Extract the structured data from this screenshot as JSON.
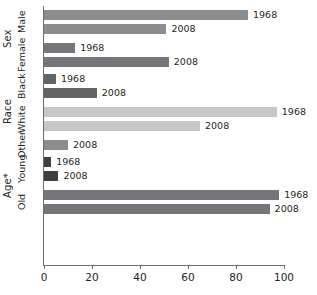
{
  "chart_data": {
    "type": "bar",
    "orientation": "horizontal",
    "title": "",
    "xlabel": "",
    "ylabel": "",
    "xlim": [
      0,
      100
    ],
    "xticks": [
      0,
      20,
      40,
      60,
      80,
      100
    ],
    "grid": false,
    "legend": "none",
    "note": "Age*",
    "groups": [
      {
        "group": "Sex",
        "categories": [
          {
            "name": "Male",
            "color": "#8c8d8f",
            "bars": [
              {
                "label": "1968",
                "value": 85
              },
              {
                "label": "2008",
                "value": 51
              }
            ]
          },
          {
            "name": "Female",
            "color": "#757679",
            "bars": [
              {
                "label": "1968",
                "value": 13
              },
              {
                "label": "2008",
                "value": 52
              }
            ]
          }
        ]
      },
      {
        "group": "Race",
        "categories": [
          {
            "name": "Black",
            "color": "#636466",
            "bars": [
              {
                "label": "1968",
                "value": 5
              },
              {
                "label": "2008",
                "value": 22
              }
            ]
          },
          {
            "name": "White",
            "color": "#c6c7c9",
            "bars": [
              {
                "label": "1968",
                "value": 97
              },
              {
                "label": "2008",
                "value": 65
              }
            ]
          },
          {
            "name": "Other",
            "color": "#8c8d8f",
            "bars": [
              {
                "label": "2008",
                "value": 10
              }
            ]
          }
        ]
      },
      {
        "group": "Age*",
        "categories": [
          {
            "name": "Young",
            "color": "#3f4042",
            "bars": [
              {
                "label": "1968",
                "value": 3
              },
              {
                "label": "2008",
                "value": 6
              }
            ]
          },
          {
            "name": "Old",
            "color": "#757679",
            "bars": [
              {
                "label": "1968",
                "value": 98
              },
              {
                "label": "2008",
                "value": 94
              }
            ]
          }
        ]
      }
    ]
  },
  "axis": {
    "tick_labels": [
      "0",
      "20",
      "40",
      "60",
      "80",
      "100"
    ]
  }
}
